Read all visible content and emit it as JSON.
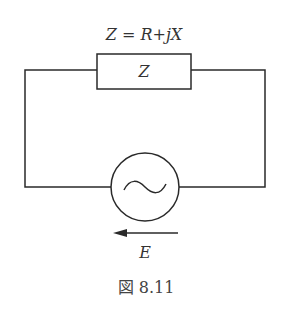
{
  "figure": {
    "formula_label": "Z = R+jX",
    "impedance_label": "Z",
    "source_label": "E",
    "caption": "図 8.11"
  },
  "diagram": {
    "type": "circuit",
    "components": [
      {
        "kind": "impedance",
        "symbol": "rectangle",
        "label": "Z",
        "position": "top"
      },
      {
        "kind": "ac-voltage-source",
        "symbol": "circle-with-sine",
        "label": "E",
        "position": "bottom"
      }
    ],
    "arrow_direction": "left",
    "colors": {
      "stroke": "#2a2a2a",
      "text": "#333333"
    }
  }
}
